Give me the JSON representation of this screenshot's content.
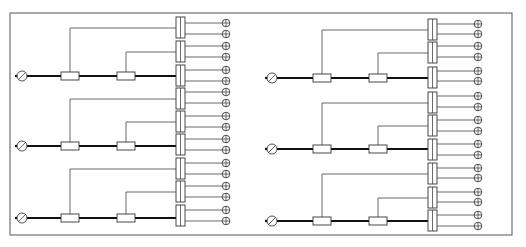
{
  "diagram": {
    "type": "electrical-distribution-schematic",
    "frame": {
      "x": 10,
      "y": 13,
      "width": 502,
      "height": 222,
      "stroke": "#555555"
    },
    "colors": {
      "bus": "#111111",
      "wire": "#444444"
    },
    "panels": [
      {
        "name": "left-panel",
        "source_x": 22,
        "fuse1_x": 70,
        "fuse2_x": 126,
        "block_x": 176,
        "plug_x": 226,
        "groups": [
          {
            "bus_y": 76,
            "blocks": [
              {
                "top": 17,
                "plugs": [
                  23,
                  34
                ]
              },
              {
                "top": 41,
                "plugs": [
                  46,
                  57
                ]
              },
              {
                "top": 65,
                "plugs": [
                  70,
                  81
                ]
              }
            ]
          },
          {
            "bus_y": 146,
            "blocks": [
              {
                "top": 88,
                "plugs": [
                  92,
                  103
                ]
              },
              {
                "top": 111,
                "plugs": [
                  116,
                  127
                ]
              },
              {
                "top": 134,
                "plugs": [
                  139,
                  150
                ]
              }
            ]
          },
          {
            "bus_y": 218,
            "blocks": [
              {
                "top": 158,
                "plugs": [
                  163,
                  174
                ]
              },
              {
                "top": 181,
                "plugs": [
                  186,
                  197
                ]
              },
              {
                "top": 205,
                "plugs": [
                  210,
                  221
                ]
              }
            ]
          }
        ]
      },
      {
        "name": "right-panel",
        "source_x": 272,
        "fuse1_x": 322,
        "fuse2_x": 378,
        "block_x": 428,
        "plug_x": 478,
        "groups": [
          {
            "bus_y": 78,
            "blocks": [
              {
                "top": 19,
                "plugs": [
                  24,
                  34
                ]
              },
              {
                "top": 42,
                "plugs": [
                  46,
                  57
                ]
              },
              {
                "top": 67,
                "plugs": [
                  71,
                  81
                ]
              }
            ]
          },
          {
            "bus_y": 149,
            "blocks": [
              {
                "top": 92,
                "plugs": [
                  96,
                  107
                ]
              },
              {
                "top": 115,
                "plugs": [
                  120,
                  131
                ]
              },
              {
                "top": 139,
                "plugs": [
                  144,
                  155
                ]
              }
            ]
          },
          {
            "bus_y": 221,
            "blocks": [
              {
                "top": 163,
                "plugs": [
                  168,
                  178
                ]
              },
              {
                "top": 187,
                "plugs": [
                  192,
                  202
                ]
              },
              {
                "top": 210,
                "plugs": [
                  215,
                  226
                ]
              }
            ]
          }
        ]
      }
    ],
    "symbols": {
      "source": "power-source-circle-slash",
      "fuse": "fuse-rectangle",
      "terminal": "double-terminal-block",
      "outlet": "plug-circle-cross"
    }
  }
}
